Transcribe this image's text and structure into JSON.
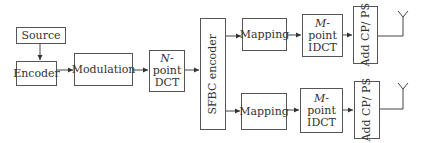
{
  "diagram": {
    "blocks": {
      "source": "Source",
      "encoder": "Encoder",
      "modulation": "Modulation",
      "ndct": {
        "var": "N",
        "line1_suffix": "-",
        "line2": "point",
        "line3": "DCT"
      },
      "sfbc": "SFBC encoder",
      "mapping_top": "Mapping",
      "midct_top": {
        "var": "M",
        "line1_suffix": "-",
        "line2": "point",
        "line3": "IDCT"
      },
      "addcp_top": "Add CP/ PS",
      "mapping_bottom": "Mapping",
      "midct_bottom": {
        "var": "M",
        "line1_suffix": "-point",
        "line2": "IDCT"
      },
      "addcp_bottom": "Add CP/ PS"
    },
    "antennas": [
      "antenna-1",
      "antenna-2"
    ],
    "colors": {
      "line": "#555555",
      "text": "#333333",
      "background": "#ffffff"
    }
  }
}
